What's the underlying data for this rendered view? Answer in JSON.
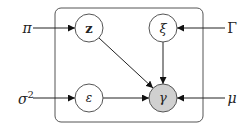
{
  "diagram": {
    "type": "graphical-model-plate",
    "plate": {
      "x": 55,
      "y": 8,
      "width": 148,
      "height": 114,
      "radius": 6
    },
    "colors": {
      "stroke": "#555555",
      "edge": "#222222",
      "observed_fill": "#d0d0d0",
      "latent_fill": "#ffffff"
    },
    "nodes": [
      {
        "id": "z",
        "label": "z",
        "bold": true,
        "cx": 89,
        "cy": 28,
        "r": 14,
        "observed": false
      },
      {
        "id": "xi",
        "label": "ξ",
        "bold": false,
        "cx": 163,
        "cy": 28,
        "r": 14,
        "observed": false
      },
      {
        "id": "eps",
        "label": "ε",
        "bold": false,
        "cx": 89,
        "cy": 98,
        "r": 14,
        "observed": false
      },
      {
        "id": "gamma",
        "label": "γ",
        "bold": false,
        "cx": 163,
        "cy": 98,
        "r": 14,
        "observed": true
      }
    ],
    "hyperparameters": [
      {
        "id": "pi",
        "label": "π",
        "x": 27,
        "y": 33,
        "target": "z"
      },
      {
        "id": "sigma2",
        "label": "σ",
        "sup": "2",
        "x": 18,
        "y": 104,
        "target": "eps"
      },
      {
        "id": "Gamma",
        "label": "Γ",
        "x": 232,
        "y": 33,
        "target": "xi"
      },
      {
        "id": "mu",
        "label": "μ",
        "x": 232,
        "y": 103,
        "target": "gamma"
      }
    ],
    "edges": [
      {
        "from": "pi",
        "to": "z"
      },
      {
        "from": "Gamma",
        "to": "xi"
      },
      {
        "from": "sigma2",
        "to": "eps"
      },
      {
        "from": "mu",
        "to": "gamma"
      },
      {
        "from": "z",
        "to": "gamma"
      },
      {
        "from": "xi",
        "to": "gamma"
      },
      {
        "from": "eps",
        "to": "gamma"
      }
    ]
  }
}
